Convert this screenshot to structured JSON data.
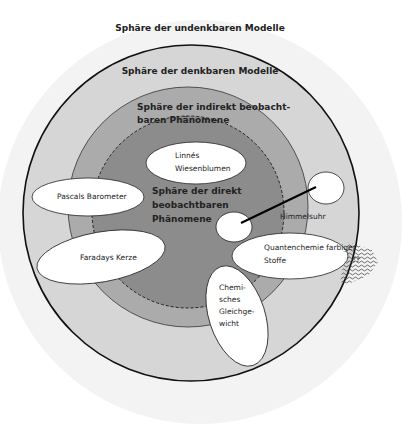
{
  "spheres": {
    "undenkbar": {
      "label": "Sphäre der undenkbaren Modelle",
      "color": "#f3f3f3"
    },
    "denkbar": {
      "label": "Sphäre der denkbaren Modelle",
      "color": "#d6d6d6"
    },
    "indirekt": {
      "label_line1": "Sphäre der indirekt beobacht-",
      "label_line2": "baren Phänomene",
      "color": "#ababab"
    },
    "direkt": {
      "label_line1": "Sphäre der direkt",
      "label_line2": "beobachtbaren",
      "label_line3": "Phänomene",
      "color": "#8c8c8c"
    }
  },
  "models": {
    "linne": {
      "line1": "Linnés",
      "line2": "Wiesenblumen"
    },
    "pascal": {
      "label": "Pascals Barometer"
    },
    "faraday": {
      "label": "Faradays Kerze"
    },
    "himmelsuhr": {
      "label": "Himmelsuhr"
    },
    "quanten": {
      "line1": "Quantenchemie farbiger",
      "line2": "Stoffe"
    },
    "gleichgewicht": {
      "line1": "Chemi-",
      "line2": "sches",
      "line3": "Gleichge-",
      "line4": "wicht"
    },
    "unknown_mark": "??"
  }
}
